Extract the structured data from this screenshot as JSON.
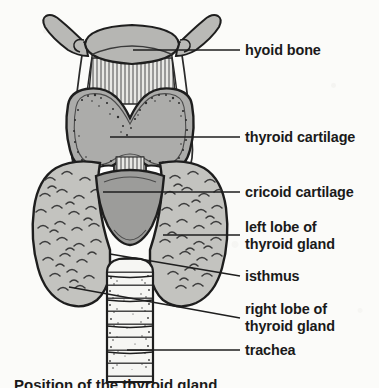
{
  "figure": {
    "caption_partial": "Position of the thyroid gland",
    "background_color": "#fbfbf9",
    "ink_color": "#1a1a1a",
    "fill_cartilage": "#b0b0ae",
    "fill_cricoid": "#9b9b99",
    "fill_gland": "#c2c2be",
    "fill_trachea": "#f4f4f1",
    "structures": [
      {
        "id": "hyoid-bone",
        "label": "hyoid bone",
        "lines": [
          "hyoid bone"
        ],
        "leader": {
          "x1": 133,
          "y1": 50,
          "x2": 240,
          "y2": 50
        },
        "label_x": 245,
        "label_y": 42
      },
      {
        "id": "thyroid-cartilage",
        "label": "thyroid cartilage",
        "lines": [
          "thyroid cartilage"
        ],
        "leader": {
          "x1": 110,
          "y1": 137,
          "x2": 240,
          "y2": 137
        },
        "label_x": 245,
        "label_y": 129
      },
      {
        "id": "cricoid-cartilage",
        "label": "cricoid cartilage",
        "lines": [
          "cricoid cartilage"
        ],
        "leader": {
          "x1": 103,
          "y1": 192,
          "x2": 240,
          "y2": 192
        },
        "label_x": 245,
        "label_y": 184
      },
      {
        "id": "left-lobe-thyroid-gland",
        "label": "left lobe of thyroid gland",
        "lines": [
          "left lobe of",
          "thyroid gland"
        ],
        "leader": {
          "x1": 163,
          "y1": 235,
          "x2": 240,
          "y2": 235
        },
        "label_x": 245,
        "label_y": 219
      },
      {
        "id": "isthmus",
        "label": "isthmus",
        "lines": [
          "isthmus"
        ],
        "leader": {
          "x1": 110,
          "y1": 254,
          "x2": 240,
          "y2": 276
        },
        "label_x": 245,
        "label_y": 268
      },
      {
        "id": "right-lobe-thyroid-gland",
        "label": "right lobe of thyroid gland",
        "lines": [
          "right lobe of",
          "thyroid gland"
        ],
        "leader": {
          "x1": 69,
          "y1": 287,
          "x2": 240,
          "y2": 318
        },
        "label_x": 245,
        "label_y": 301
      },
      {
        "id": "trachea",
        "label": "trachea",
        "lines": [
          "trachea"
        ],
        "leader": {
          "x1": 127,
          "y1": 350,
          "x2": 240,
          "y2": 350
        },
        "label_x": 245,
        "label_y": 342
      }
    ]
  }
}
